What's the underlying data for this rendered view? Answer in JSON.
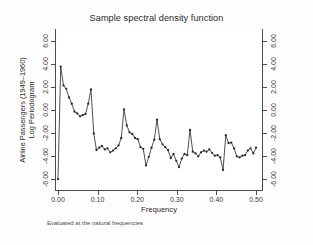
{
  "chart_data": {
    "type": "line",
    "title": "Sample spectral density function",
    "subtitle": "",
    "xlabel": "Frequency",
    "ylabel_line1": "Airline Passengers (1949–1960)",
    "ylabel_line2": "Log Periodogram",
    "note": "Evaluated at the natural frequencies",
    "xlim": [
      -0.005,
      0.515
    ],
    "ylim": [
      -7.0,
      7.0
    ],
    "xticks": [
      0.0,
      0.1,
      0.2,
      0.3,
      0.4,
      0.5
    ],
    "xticklabels": [
      "0.00",
      "0.10",
      "0.20",
      "0.30",
      "0.40",
      "0.50"
    ],
    "yticks": [
      6,
      4,
      2,
      0,
      -2,
      -4,
      -6
    ],
    "yticklabels": [
      "6.00",
      "4.00",
      "2.00",
      "0.00",
      "-2.00",
      "-4.00",
      "-6.00"
    ],
    "grid": false,
    "legend": "none",
    "marker": "circle",
    "line_color": "#3c3c3c",
    "marker_color": "#2a2a2a",
    "axis_color": "#4d4d4d",
    "plot_bg": "#ffffff",
    "figure_bg": "#fdfdfd",
    "series": [
      {
        "name": "Log Periodogram",
        "x": [
          0.0,
          0.0069,
          0.0139,
          0.0208,
          0.0278,
          0.0347,
          0.0417,
          0.0486,
          0.0556,
          0.0625,
          0.0694,
          0.0764,
          0.0833,
          0.0903,
          0.0972,
          0.1042,
          0.1111,
          0.1181,
          0.125,
          0.1319,
          0.1389,
          0.1458,
          0.1528,
          0.1597,
          0.1667,
          0.1736,
          0.1806,
          0.1875,
          0.1944,
          0.2014,
          0.2083,
          0.2153,
          0.2222,
          0.2292,
          0.2361,
          0.2431,
          0.25,
          0.2569,
          0.2639,
          0.2708,
          0.2778,
          0.2847,
          0.2917,
          0.2986,
          0.3056,
          0.3125,
          0.3194,
          0.3264,
          0.3333,
          0.3403,
          0.3472,
          0.3542,
          0.3611,
          0.3681,
          0.375,
          0.3819,
          0.3889,
          0.3958,
          0.4028,
          0.4097,
          0.4167,
          0.4236,
          0.4306,
          0.4375,
          0.4444,
          0.4514,
          0.4583,
          0.4653,
          0.4722,
          0.4792,
          0.4861,
          0.4931,
          0.5
        ],
        "y": [
          -6.05,
          3.8,
          2.15,
          1.85,
          1.1,
          0.55,
          -0.15,
          -0.3,
          -0.55,
          -0.45,
          -0.35,
          0.55,
          1.8,
          -2.05,
          -3.5,
          -3.3,
          -3.15,
          -3.45,
          -3.35,
          -3.7,
          -3.55,
          -3.35,
          -3.1,
          -2.45,
          0.05,
          -1.35,
          -1.95,
          -2.1,
          -2.45,
          -2.55,
          -3.25,
          -3.4,
          -4.85,
          -4.1,
          -3.3,
          -2.6,
          -0.85,
          -2.55,
          -3.0,
          -3.25,
          -3.5,
          -4.2,
          -3.85,
          -4.45,
          -5.0,
          -4.25,
          -3.85,
          -3.95,
          -1.75,
          -3.65,
          -3.8,
          -4.05,
          -3.7,
          -3.55,
          -3.65,
          -3.45,
          -3.75,
          -4.0,
          -3.95,
          -4.15,
          -5.25,
          -2.2,
          -2.9,
          -2.85,
          -3.35,
          -4.05,
          -4.15,
          -4.0,
          -3.95,
          -3.55,
          -3.35,
          -3.8,
          -3.3
        ]
      }
    ]
  }
}
